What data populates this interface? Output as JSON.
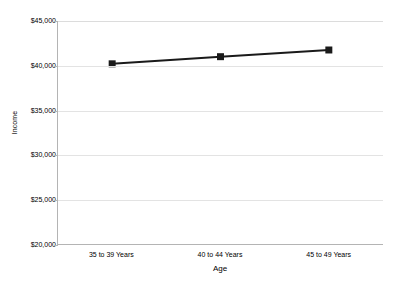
{
  "chart_data": {
    "type": "line",
    "title": "",
    "subtitle": "",
    "xlabel": "Age",
    "ylabel": "Income",
    "categories": [
      "35 to 39 Years",
      "40 to 44 Years",
      "45 to 49 Years"
    ],
    "values": [
      40200,
      41000,
      41750
    ],
    "series": [
      {
        "name": "Income",
        "values": [
          40200,
          41000,
          41750
        ],
        "color": "#1a1a1a",
        "marker": "square",
        "marker_color": "#1a1a1a"
      }
    ],
    "ylim": [
      20000,
      45000
    ],
    "ytick_values": [
      45000,
      40000,
      35000,
      30000,
      25000,
      20000
    ],
    "ytick_labels": [
      "$45,000",
      "$40,000",
      "$35,000",
      "$30,000",
      "$25,000",
      "$20,000"
    ],
    "grid": true,
    "grid_axis": "y",
    "grid_color": "#e3e3e3",
    "legend": false,
    "legend_position": "none",
    "axis_color": "#b4b4b4",
    "background_color": "#ffffff",
    "annotations": []
  },
  "axes": {
    "y_title": "Income",
    "x_title": "Age"
  }
}
